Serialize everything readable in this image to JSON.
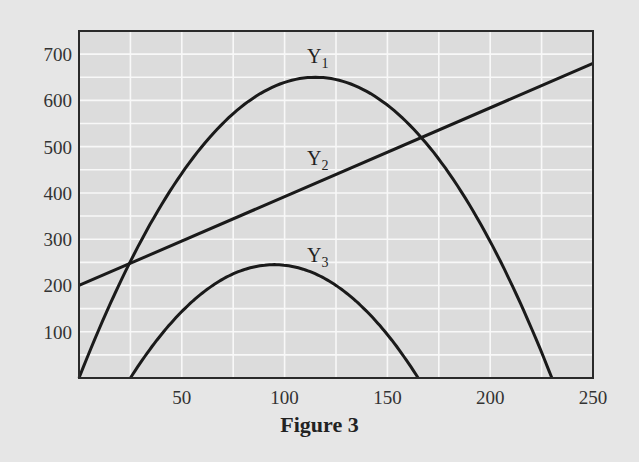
{
  "figure": {
    "caption": "Figure 3"
  },
  "chart_data": {
    "type": "line",
    "title": "",
    "caption": "Figure 3",
    "xlabel": "",
    "ylabel": "",
    "xlim": [
      0,
      250
    ],
    "ylim": [
      0,
      750
    ],
    "x_ticks": [
      50,
      100,
      150,
      200,
      250
    ],
    "y_ticks": [
      100,
      200,
      300,
      400,
      500,
      600,
      700
    ],
    "x_minor_grid_step": 25,
    "y_minor_grid_step": 50,
    "grid": true,
    "legend": "inline labels",
    "series": [
      {
        "name": "Y1",
        "label_main": "Y",
        "label_sub": "1",
        "shape": "downward parabola",
        "x": [
          0,
          25,
          50,
          75,
          100,
          115,
          125,
          150,
          175,
          200,
          230
        ],
        "y": [
          0,
          250,
          435,
          565,
          635,
          650,
          645,
          590,
          480,
          320,
          0
        ]
      },
      {
        "name": "Y2",
        "label_main": "Y",
        "label_sub": "2",
        "shape": "straight line",
        "x": [
          0,
          50,
          100,
          150,
          200,
          250
        ],
        "y": [
          200,
          295,
          390,
          490,
          585,
          680
        ]
      },
      {
        "name": "Y3",
        "label_main": "Y",
        "label_sub": "3",
        "shape": "downward parabola",
        "x": [
          25,
          50,
          75,
          95,
          125,
          150,
          165
        ],
        "y": [
          0,
          145,
          225,
          245,
          200,
          95,
          0
        ]
      }
    ],
    "intersections": [
      {
        "curves": [
          "Y1",
          "Y2"
        ],
        "x": 25,
        "y": 248
      },
      {
        "curves": [
          "Y1",
          "Y2"
        ],
        "x": 168,
        "y": 525
      }
    ]
  },
  "colors": {
    "background": "#e6e6e6",
    "plot_background": "#dcdcdc",
    "gridline": "#f8f8f8",
    "curve": "#1a1a1a",
    "frame": "#2a2a2a"
  }
}
